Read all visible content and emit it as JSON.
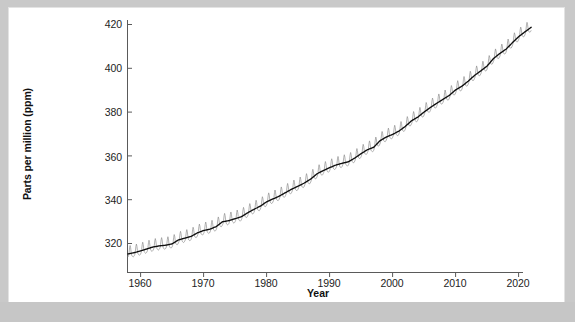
{
  "figure": {
    "background_color": "#ffffff",
    "frame_color": "#c9c9c9",
    "axis_color": "#555555"
  },
  "axis": {
    "ylabel": "Parts per million (ppm)",
    "xlabel": "Year",
    "yticks": [
      320,
      340,
      360,
      380,
      400,
      420
    ],
    "xticks": [
      1960,
      1970,
      1980,
      1990,
      2000,
      2010,
      2020
    ]
  },
  "chart_data": {
    "type": "line",
    "title": "",
    "xlabel": "Year",
    "ylabel": "Parts per million (ppm)",
    "xlim": [
      1957.5,
      2022.8
    ],
    "ylim": [
      311,
      421
    ],
    "grid": false,
    "legend": "none",
    "seasonal_amplitude_ppm": 3.0,
    "series": [
      {
        "name": "Annual trend (ppm)",
        "color": "#111111",
        "x": [
          1958,
          1959,
          1960,
          1961,
          1962,
          1963,
          1964,
          1965,
          1966,
          1967,
          1968,
          1969,
          1970,
          1971,
          1972,
          1973,
          1974,
          1975,
          1976,
          1977,
          1978,
          1979,
          1980,
          1981,
          1982,
          1983,
          1984,
          1985,
          1986,
          1987,
          1988,
          1989,
          1990,
          1991,
          1992,
          1993,
          1994,
          1995,
          1996,
          1997,
          1998,
          1999,
          2000,
          2001,
          2002,
          2003,
          2004,
          2005,
          2006,
          2007,
          2008,
          2009,
          2010,
          2011,
          2012,
          2013,
          2014,
          2015,
          2016,
          2017,
          2018,
          2019,
          2020,
          2021,
          2022
        ],
        "values": [
          315.0,
          315.6,
          316.4,
          317.3,
          318.2,
          318.7,
          319.0,
          319.6,
          321.4,
          322.2,
          323.0,
          324.6,
          325.7,
          326.3,
          327.5,
          329.7,
          330.2,
          331.1,
          332.0,
          333.8,
          335.4,
          336.8,
          338.8,
          340.1,
          341.4,
          343.0,
          344.6,
          346.0,
          347.4,
          349.2,
          351.6,
          353.1,
          354.4,
          355.6,
          356.4,
          357.1,
          358.8,
          360.8,
          362.6,
          363.7,
          366.7,
          368.4,
          369.6,
          371.1,
          373.2,
          375.8,
          377.5,
          379.8,
          381.9,
          383.8,
          385.6,
          387.4,
          389.9,
          391.6,
          393.9,
          396.5,
          398.6,
          400.8,
          404.2,
          406.5,
          408.5,
          411.4,
          414.2,
          416.4,
          418.5
        ]
      },
      {
        "name": "Monthly record with seasonal cycle (ppm)",
        "color": "#8c8c8c",
        "description": "Monthly values oscillate about the trend with a ~6 ppm peak-to-trough annual cycle, maximum in May, minimum in September."
      }
    ],
    "first_point": {
      "year": 1958,
      "value": 315.0
    },
    "last_point": {
      "year": 2022,
      "value": 418.5
    }
  }
}
